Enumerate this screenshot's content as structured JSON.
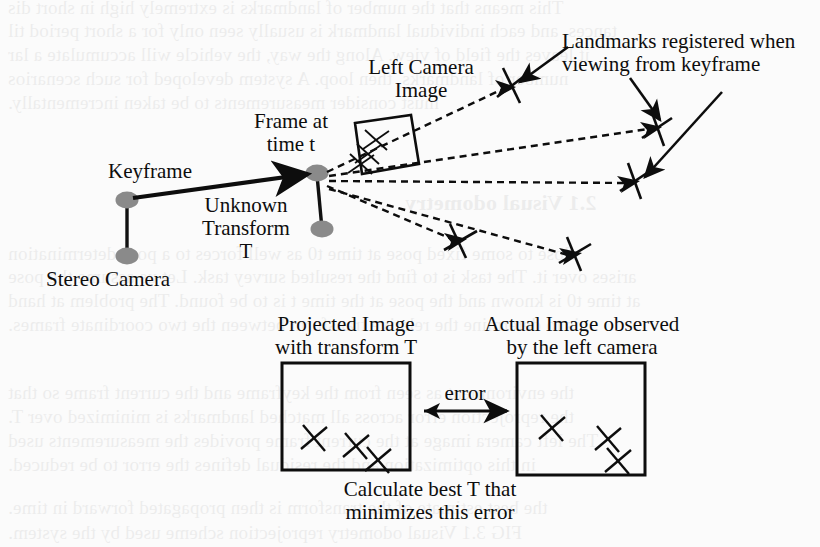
{
  "figure": {
    "kind": "visual-odometry-diagram",
    "background_color": "#fbfbfb",
    "ink_color": "#0d0d0d",
    "marker_fill": "#8a8a8a",
    "labels": {
      "keyframe": "Keyframe",
      "stereo_camera": "Stereo Camera",
      "unknown_transform_l1": "Unknown",
      "unknown_transform_l2": "Transform",
      "unknown_transform_l3": "T",
      "frame_at_l1": "Frame at",
      "frame_at_l2": "time t",
      "left_camera_image_l1": "Left Camera",
      "left_camera_image_l2": "Image",
      "landmarks_l1": "Landmarks registered when",
      "landmarks_l2": "viewing from keyframe",
      "projected_image_l1": "Projected Image",
      "projected_image_l2": "with transform T",
      "actual_image_l1": "Actual Image observed",
      "actual_image_l2": "by the left camera",
      "error": "error",
      "calculate_l1": "Calculate best T that",
      "calculate_l2": "minimizes this error"
    },
    "caption_fragment": "FIG 3.1",
    "ghost_text": [
      {
        "text": "This means that the number of landmarks is extremely high in short dis",
        "x": 8,
        "y": -3,
        "size": 19
      },
      {
        "text": "tances, and each individual landmark is usually seen only for a short period til",
        "x": 8,
        "y": 20,
        "size": 19
      },
      {
        "text": "it leaves the field of view. Along the way, the vehicle will accumulate a lar",
        "x": 8,
        "y": 44,
        "size": 19
      },
      {
        "text": "number of landmarks, then loop. A system developed for such scenarios",
        "x": 8,
        "y": 68,
        "size": 19
      },
      {
        "text": "must consider measurements to be taken incrementally.",
        "x": 8,
        "y": 92,
        "size": 19
      },
      {
        "text": "2.1   Visual odometry",
        "x": 405,
        "y": 190,
        "size": 22,
        "bold": true
      },
      {
        "text": "close to some fixed pose at time t0 as well forces to a pose determination",
        "x": 8,
        "y": 243,
        "size": 19
      },
      {
        "text": "arises over it. The task is to find the resulted survey task. Let us assume the pose",
        "x": 8,
        "y": 266,
        "size": 19
      },
      {
        "text": "at time t0 is known and the pose at the time t is to be found. The problem at hand",
        "x": 8,
        "y": 290,
        "size": 19
      },
      {
        "text": "is to determine the relative transform between the two coordinate frames.",
        "x": 8,
        "y": 314,
        "size": 19
      },
      {
        "text": "the environment as seen from the keyframe and the current frame so that",
        "x": 8,
        "y": 382,
        "size": 19
      },
      {
        "text": "the reprojection error across all matched landmarks is minimized over T.",
        "x": 8,
        "y": 406,
        "size": 19
      },
      {
        "text": "The left camera image at the current frame provides the measurements used",
        "x": 8,
        "y": 430,
        "size": 19
      },
      {
        "text": "in this optimization and the residual defines the error to be reduced.",
        "x": 8,
        "y": 454,
        "size": 19
      },
      {
        "text": "the best estimate of the transform is then propagated forward in time.",
        "x": 8,
        "y": 497,
        "size": 19
      },
      {
        "text": "FIG 3.1   Visual odometry reprojection scheme used by the system.",
        "x": 8,
        "y": 522,
        "size": 19
      }
    ],
    "markers": [
      {
        "name": "keyframe-camera-top",
        "cx": 127,
        "cy": 200,
        "rx": 11,
        "ry": 8
      },
      {
        "name": "keyframe-camera-bottom",
        "cx": 127,
        "cy": 256,
        "rx": 11,
        "ry": 8
      },
      {
        "name": "current-frame-top",
        "cx": 317,
        "cy": 173,
        "rx": 11,
        "ry": 8
      },
      {
        "name": "current-frame-bottom",
        "cx": 322,
        "cy": 229,
        "rx": 11,
        "ry": 8
      }
    ],
    "landmarks": [
      {
        "name": "landmark-1",
        "cx": 512,
        "cy": 85,
        "a": 28
      },
      {
        "name": "landmark-2",
        "cx": 657,
        "cy": 127,
        "a": 28
      },
      {
        "name": "landmark-3",
        "cx": 635,
        "cy": 180,
        "a": 28
      },
      {
        "name": "landmark-4",
        "cx": 460,
        "cy": 240,
        "a": 28
      },
      {
        "name": "landmark-5",
        "cx": 575,
        "cy": 253,
        "a": 28
      }
    ],
    "left_box": {
      "x": 282,
      "y": 363,
      "w": 128,
      "h": 107
    },
    "right_box": {
      "x": 517,
      "y": 363,
      "w": 128,
      "h": 112
    }
  }
}
